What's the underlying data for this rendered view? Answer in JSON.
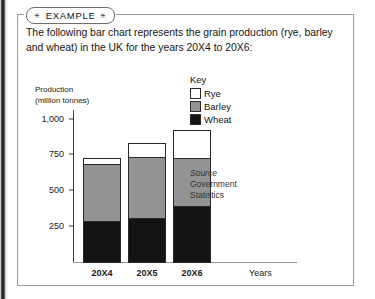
{
  "example": {
    "tag_label": "EXAMPLE",
    "star_glyph": "✳",
    "description": "The following bar chart represents the grain production (rye, barley and wheat) in the UK for the years 20X4 to 20X6:"
  },
  "key": {
    "title": "Key",
    "items": [
      {
        "label": "Rye",
        "color": "#ffffff"
      },
      {
        "label": "Barley",
        "color": "#939393"
      },
      {
        "label": "Wheat",
        "color": "#141414"
      }
    ]
  },
  "source": {
    "word": "Source",
    "lines": [
      "Government",
      "Statistics"
    ]
  },
  "chart_data": {
    "type": "bar",
    "stacked": true,
    "title": "",
    "ylabel": "Production\n(million tonnes)",
    "ylabel_line1": "Production",
    "ylabel_line2": "(million tonnes)",
    "xlabel": "Years",
    "categories": [
      "20X4",
      "20X5",
      "20X6"
    ],
    "yticks": [
      "250",
      "500",
      "750",
      "1,000"
    ],
    "ytick_values": [
      250,
      500,
      750,
      1000
    ],
    "ylim": [
      0,
      1060
    ],
    "grid": false,
    "legend_position": "right",
    "series": [
      {
        "name": "Wheat",
        "color": "#141414",
        "values": [
          290,
          305,
          395
        ]
      },
      {
        "name": "Barley",
        "color": "#939393",
        "values": [
          400,
          435,
          330
        ]
      },
      {
        "name": "Rye",
        "color": "#ffffff",
        "values": [
          35,
          90,
          195
        ]
      }
    ],
    "totals": [
      725,
      830,
      920
    ]
  }
}
